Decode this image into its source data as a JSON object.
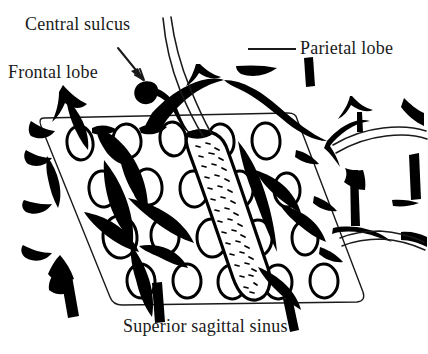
{
  "figure": {
    "kind": "anatomical-line-drawing",
    "background_color": "#ffffff",
    "ink_color": "#000000",
    "text_color": "#1a1a1a"
  },
  "labels": {
    "central_sulcus": "Central sulcus",
    "frontal_lobe": "Frontal lobe",
    "parietal_lobe": "Parietal lobe",
    "superior_sagittal_sinus": "Superior sagittal sinus"
  },
  "leaders": {
    "central_sulcus_arrow": "arrow pointing down-right from text to sulcus",
    "parietal_lobe_line": "horizontal rule left of text"
  },
  "structures": [
    {
      "name": "dissection-frame",
      "description": "rounded parallelogram outlining the exposed dural window"
    },
    {
      "name": "arachnoid-granulations",
      "description": "white ovals with black outlines in rows"
    },
    {
      "name": "cortical-veins",
      "description": "thick black branching vessels"
    },
    {
      "name": "superior-sagittal-sinus-band",
      "description": "stippled dotted band running diagonally"
    },
    {
      "name": "central-sulcus-vessel",
      "description": "thin double curve descending from top"
    }
  ]
}
